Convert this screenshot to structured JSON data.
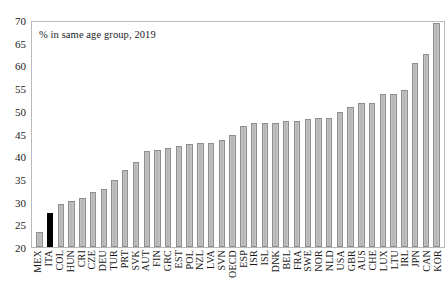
{
  "annotation": "% in same age group, 2019",
  "colors": {
    "bar_fill": "#bfbfbf",
    "bar_border": "#8e8e8e",
    "highlight": "#000000",
    "frame": "#b9b9b9",
    "text": "#1a1a1a"
  },
  "highlight_category": "ITA",
  "chart_data": {
    "type": "bar",
    "title": "",
    "subtitle": "",
    "annotation": "% in same age group, 2019",
    "xlabel": "",
    "ylabel": "",
    "ylim": [
      20,
      70
    ],
    "yticks": [
      20,
      25,
      30,
      35,
      40,
      45,
      50,
      55,
      60,
      65,
      70
    ],
    "grid": false,
    "legend": null,
    "highlight": "ITA",
    "categories": [
      "MEX",
      "ITA",
      "COL",
      "HUN",
      "CRI",
      "CZE",
      "DEU",
      "TUR",
      "PRT",
      "SVK",
      "AUT",
      "FIN",
      "GRC",
      "EST",
      "POL",
      "NZL",
      "LVA",
      "SVN",
      "OECD",
      "ESP",
      "ISR",
      "ISL",
      "DNK",
      "BEL",
      "FRA",
      "SWE",
      "NOR",
      "NLD",
      "USA",
      "GBR",
      "AUS",
      "CHE",
      "LUX",
      "LTU",
      "IRL",
      "JPN",
      "CAN",
      "KOR"
    ],
    "values": [
      23.3,
      27.6,
      29.6,
      30.3,
      31.0,
      32.3,
      32.9,
      35.0,
      37.1,
      38.9,
      41.3,
      41.5,
      42.0,
      42.4,
      43.0,
      43.1,
      43.2,
      43.7,
      45.0,
      46.9,
      47.5,
      47.5,
      47.5,
      48.1,
      48.1,
      48.5,
      48.6,
      48.7,
      50.0,
      51.1,
      52.0,
      52.0,
      53.9,
      54.0,
      55.0,
      61.0,
      63.0,
      69.8
    ]
  }
}
